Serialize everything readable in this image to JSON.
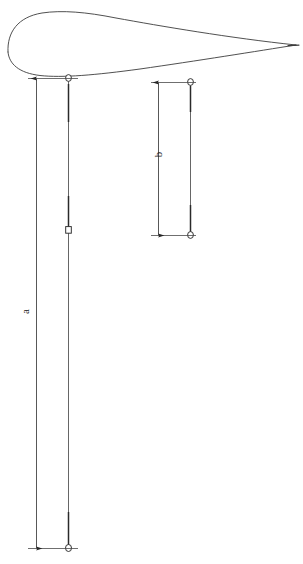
{
  "figure": {
    "kind": "technical-line-drawing",
    "background_color": "#ffffff",
    "line_color": "#3a3a3a",
    "label_color": "#1a1a1a"
  },
  "airfoil": {
    "name": "airfoil-profile",
    "leading_edge_x": 4,
    "trailing_edge_x": 296,
    "trailing_edge_y": 45,
    "top_y": 11,
    "bottom_y": 76,
    "upper_path": "M 8 52 C 8 24, 34 11, 74 11 C 120 11, 200 27, 296 45",
    "lower_path": "M 8 52 C 8 66, 22 76, 52 76 C 110 76, 210 61, 296 45"
  },
  "dimensions": [
    {
      "id": "a",
      "name": "dimension-a",
      "label": "a",
      "orientation": "vertical",
      "line_x": 36,
      "start_y": 78,
      "end_y": 548,
      "extension_top_y": 78,
      "extension_bottom_y": 548,
      "extension_x_start": 28,
      "extension_x_end": 78,
      "label_x": 25,
      "label_y": 312,
      "label_rotation_deg": -90,
      "arrowheads": "both-ends"
    },
    {
      "id": "b",
      "name": "dimension-b",
      "label": "b",
      "orientation": "vertical",
      "line_x": 158,
      "start_y": 82,
      "end_y": 235,
      "extension_top_y": 82,
      "extension_bottom_y": 235,
      "extension_x_start": 151,
      "extension_x_end": 196,
      "label_x": 157,
      "label_y": 155,
      "label_rotation_deg": -90,
      "arrowheads": "both-ends"
    }
  ],
  "leaders": [
    {
      "id": "leader-a",
      "name": "leader-line-a",
      "x": 68,
      "top_y": 77,
      "bottom_y": 548,
      "markers": [
        {
          "name": "node-marker-top",
          "shape": "circle",
          "y": 78
        },
        {
          "name": "node-marker-middle",
          "shape": "square",
          "y": 230
        },
        {
          "name": "node-marker-bottom",
          "shape": "circle",
          "y": 548
        }
      ]
    },
    {
      "id": "leader-b",
      "name": "leader-line-b",
      "x": 190,
      "top_y": 82,
      "bottom_y": 235,
      "markers": [
        {
          "name": "node-marker-top",
          "shape": "circle",
          "y": 82
        },
        {
          "name": "node-marker-bottom",
          "shape": "circle",
          "y": 235
        }
      ]
    }
  ],
  "labels": {
    "a": "a",
    "b": "b"
  }
}
